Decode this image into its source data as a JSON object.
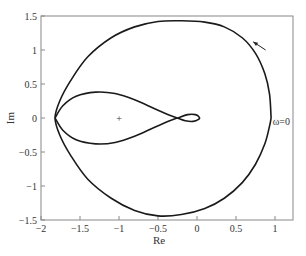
{
  "chart_data": {
    "type": "line",
    "title": "",
    "xlabel": "Re",
    "ylabel": "Im",
    "xlim": [
      -2,
      1.2
    ],
    "ylim": [
      -1.5,
      1.5
    ],
    "grid": false,
    "xticks": [
      -2,
      -1.5,
      -1,
      -0.5,
      0,
      0.5,
      1
    ],
    "xtick_labels": [
      "−2",
      "−1.5",
      "−1",
      "−0.5",
      "0",
      "0.5",
      "1"
    ],
    "yticks": [
      -1.5,
      -1,
      -0.5,
      0,
      0.5,
      1,
      1.5
    ],
    "ytick_labels": [
      "−1.5",
      "−1",
      "−0.5",
      "0",
      "0.5",
      "1",
      "1.5"
    ],
    "series": [
      {
        "name": "outer-loop",
        "color": "#1a1a1a",
        "points": [
          [
            0.95,
            0.0
          ],
          [
            0.93,
            0.35
          ],
          [
            0.87,
            0.65
          ],
          [
            0.75,
            0.95
          ],
          [
            0.58,
            1.18
          ],
          [
            0.35,
            1.34
          ],
          [
            0.1,
            1.41
          ],
          [
            -0.2,
            1.43
          ],
          [
            -0.5,
            1.42
          ],
          [
            -0.8,
            1.34
          ],
          [
            -1.1,
            1.18
          ],
          [
            -1.4,
            0.9
          ],
          [
            -1.62,
            0.55
          ],
          [
            -1.76,
            0.25
          ],
          [
            -1.82,
            0.0
          ],
          [
            -1.76,
            -0.25
          ],
          [
            -1.62,
            -0.55
          ],
          [
            -1.4,
            -0.9
          ],
          [
            -1.1,
            -1.18
          ],
          [
            -0.8,
            -1.36
          ],
          [
            -0.5,
            -1.44
          ],
          [
            -0.2,
            -1.42
          ],
          [
            0.1,
            -1.33
          ],
          [
            0.35,
            -1.18
          ],
          [
            0.58,
            -0.95
          ],
          [
            0.75,
            -0.68
          ],
          [
            0.87,
            -0.38
          ],
          [
            0.93,
            -0.12
          ],
          [
            0.95,
            0.0
          ]
        ]
      },
      {
        "name": "inner-figure-eight",
        "color": "#1a1a1a",
        "points": [
          [
            -1.82,
            0.0
          ],
          [
            -1.72,
            0.18
          ],
          [
            -1.55,
            0.32
          ],
          [
            -1.3,
            0.38
          ],
          [
            -1.05,
            0.36
          ],
          [
            -0.8,
            0.27
          ],
          [
            -0.55,
            0.14
          ],
          [
            -0.35,
            0.04
          ],
          [
            -0.25,
            0.0
          ],
          [
            -0.15,
            -0.04
          ],
          [
            -0.05,
            -0.05
          ],
          [
            0.02,
            -0.02
          ],
          [
            0.03,
            0.01
          ],
          [
            -0.02,
            0.05
          ],
          [
            -0.12,
            0.05
          ],
          [
            -0.25,
            0.0
          ],
          [
            -0.35,
            -0.04
          ],
          [
            -0.55,
            -0.14
          ],
          [
            -0.8,
            -0.27
          ],
          [
            -1.05,
            -0.36
          ],
          [
            -1.3,
            -0.38
          ],
          [
            -1.55,
            -0.32
          ],
          [
            -1.72,
            -0.18
          ],
          [
            -1.82,
            0.0
          ]
        ]
      }
    ],
    "annotations": [
      {
        "type": "marker",
        "symbol": "+",
        "x": -1,
        "y": 0,
        "label": "critical-point"
      },
      {
        "type": "arrow",
        "from": [
          0.88,
          1.0
        ],
        "to": [
          0.72,
          1.12
        ],
        "label": "direction-arrow"
      },
      {
        "type": "text",
        "text": "ω=0",
        "x": 0.97,
        "y": -0.05
      }
    ]
  }
}
